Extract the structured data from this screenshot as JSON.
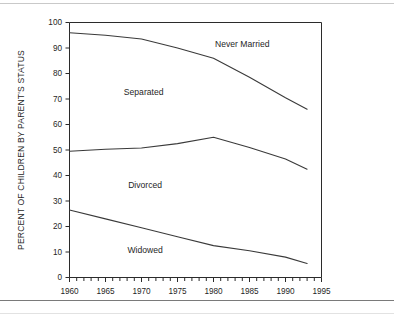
{
  "chart_data": {
    "type": "line",
    "title": "",
    "subtitle": "",
    "xlabel": "",
    "ylabel": "PERCENT OF CHILDREN BY PARENT'S STATUS",
    "xlim": [
      1960,
      1995
    ],
    "ylim": [
      0,
      100
    ],
    "grid": false,
    "legend_position": "inline-annotations",
    "x_major_ticks": [
      1960,
      1965,
      1970,
      1975,
      1980,
      1985,
      1990,
      1995
    ],
    "x_minor_tick_interval": 1,
    "y_ticks": [
      0,
      10,
      20,
      30,
      40,
      50,
      60,
      70,
      80,
      90,
      100
    ],
    "x_tick_labels": [
      "1960",
      "1965",
      "1970",
      "1975",
      "1980",
      "1985",
      "1990",
      "1995"
    ],
    "y_tick_labels": [
      "0",
      "10",
      "20",
      "30",
      "40",
      "50",
      "60",
      "70",
      "80",
      "90",
      "100"
    ],
    "x": [
      1960,
      1965,
      1970,
      1975,
      1980,
      1985,
      1990,
      1993
    ],
    "series": [
      {
        "name": "Never Married",
        "label": "Never Married",
        "label_x": 1984.0,
        "label_y": 90.5,
        "values": [
          96.0,
          95.0,
          93.5,
          90.0,
          86.0,
          78.5,
          70.5,
          66.0
        ]
      },
      {
        "name": "Separated",
        "label": "Separated",
        "label_x": 1970.3,
        "label_y": 71.5,
        "values": [
          49.5,
          50.3,
          50.8,
          52.5,
          55.0,
          51.0,
          46.5,
          42.5
        ]
      },
      {
        "name": "Divorced",
        "label": "Divorced",
        "label_x": 1970.5,
        "label_y": 35.0,
        "values": null
      },
      {
        "name": "Widowed",
        "label": "Widowed",
        "label_x": 1970.5,
        "label_y": 9.5,
        "values": [
          26.5,
          23.0,
          19.5,
          16.0,
          12.5,
          10.5,
          8.0,
          5.5
        ]
      }
    ],
    "annotations": [
      "Never Married",
      "Separated",
      "Divorced",
      "Widowed"
    ],
    "line_color": "#3a3a3a",
    "axis_color": "#2b2b2b",
    "background_color": "#ffffff"
  }
}
